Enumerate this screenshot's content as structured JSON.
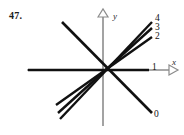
{
  "figure": {
    "number_label": "47.",
    "axes": {
      "x_label": "x",
      "y_label": "y",
      "x_axis_color": "#8c8c8c",
      "y_axis_color": "#8c8c8c",
      "origin_x": 103,
      "origin_y": 70,
      "x_axis_start": 27,
      "x_axis_end": 176,
      "y_axis_top": 10,
      "y_axis_bottom": 126
    },
    "line_color": "#111111",
    "line_labels": [
      {
        "text": "0",
        "x": 154,
        "y": 114
      },
      {
        "text": "1",
        "x": 152,
        "y": 64
      },
      {
        "text": "2",
        "x": 155,
        "y": 33
      },
      {
        "text": "3",
        "x": 155,
        "y": 24
      },
      {
        "text": "4",
        "x": 155,
        "y": 16
      }
    ]
  },
  "chart_data": {
    "type": "line",
    "title": "",
    "subtitle": "",
    "xlabel": "x",
    "ylabel": "y",
    "grid": false,
    "legend": "inline-endpoint-labels",
    "xlim": [
      -1.55,
      1.55
    ],
    "ylim": [
      -1.2,
      1.2
    ],
    "series": [
      {
        "name": "0",
        "label": "0",
        "through_origin": true,
        "endpoints": [
          [
            -0.82,
            0.96
          ],
          [
            1.05,
            -0.9
          ]
        ],
        "pixel_endpoints": [
          [
            62,
            22
          ],
          [
            152,
            113
          ]
        ]
      },
      {
        "name": "1",
        "label": "1",
        "through_origin": true,
        "endpoints": [
          [
            -1.55,
            0.0
          ],
          [
            1.52,
            0.0
          ]
        ],
        "pixel_endpoints": [
          [
            28,
            70
          ],
          [
            149,
            70
          ]
        ]
      },
      {
        "name": "2",
        "label": "2",
        "through_origin": true,
        "endpoints": [
          [
            -1.18,
            -0.58
          ],
          [
            1.22,
            0.6
          ]
        ],
        "pixel_endpoints": [
          [
            56,
            105
          ],
          [
            152,
            37
          ]
        ]
      },
      {
        "name": "3",
        "label": "3",
        "through_origin": true,
        "endpoints": [
          [
            -1.13,
            -0.72
          ],
          [
            1.22,
            0.77
          ]
        ],
        "pixel_endpoints": [
          [
            58,
            113
          ],
          [
            152,
            28
          ]
        ]
      },
      {
        "name": "4",
        "label": "4",
        "through_origin": true,
        "endpoints": [
          [
            -1.1,
            -0.83
          ],
          [
            1.22,
            0.9
          ]
        ],
        "pixel_endpoints": [
          [
            60,
            119
          ],
          [
            152,
            22
          ]
        ]
      }
    ]
  }
}
